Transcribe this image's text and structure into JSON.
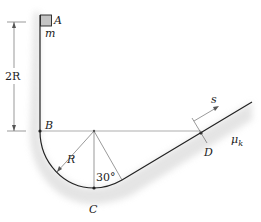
{
  "figure": {
    "labels": {
      "A": "A",
      "m": "m",
      "twoR": "2R",
      "B": "B",
      "R": "R",
      "angle": "30°",
      "C": "C",
      "D": "D",
      "s": "s",
      "mu": "μ",
      "mu_sub": "k"
    },
    "angle_deg": 30,
    "colors": {
      "line": "#222222",
      "shade": "#c8c8c8",
      "block": "#c4c4c4"
    }
  }
}
